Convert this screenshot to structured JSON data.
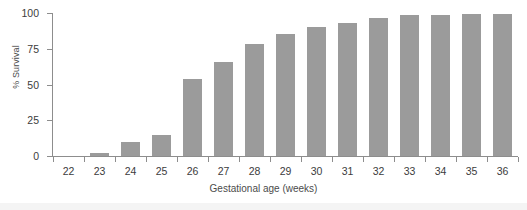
{
  "chart_data": {
    "type": "bar",
    "title": "",
    "subtitle": "",
    "xlabel": "Gestational age (weeks)",
    "ylabel": "% Survival",
    "categories": [
      "22",
      "23",
      "24",
      "25",
      "26",
      "27",
      "28",
      "29",
      "30",
      "31",
      "32",
      "33",
      "34",
      "35",
      "36"
    ],
    "values": [
      0,
      2,
      10,
      15,
      54,
      66,
      78,
      85,
      90,
      93,
      96.5,
      98.5,
      98.5,
      99.5,
      99.5
    ],
    "series": [
      {
        "name": "% Survival",
        "values": [
          0,
          2,
          10,
          15,
          54,
          66,
          78,
          85,
          90,
          93,
          96.5,
          98.5,
          98.5,
          99.5,
          99.5
        ]
      }
    ],
    "ylim": [
      0,
      100
    ],
    "yticks": [
      0,
      25,
      50,
      75,
      100
    ],
    "ytick_labels": [
      "0",
      "25",
      "50",
      "75",
      "100"
    ],
    "xtick_labels": [
      "22",
      "23",
      "24",
      "25",
      "26",
      "27",
      "28",
      "29",
      "30",
      "31",
      "32",
      "33",
      "34",
      "35",
      "36"
    ],
    "grid": false,
    "legend": null,
    "legend_position": "none",
    "bar_color": "#9b9b9b",
    "axis_color": "#8d8d8d",
    "text_color": "#3c3c3c",
    "background": "#ffffff"
  }
}
